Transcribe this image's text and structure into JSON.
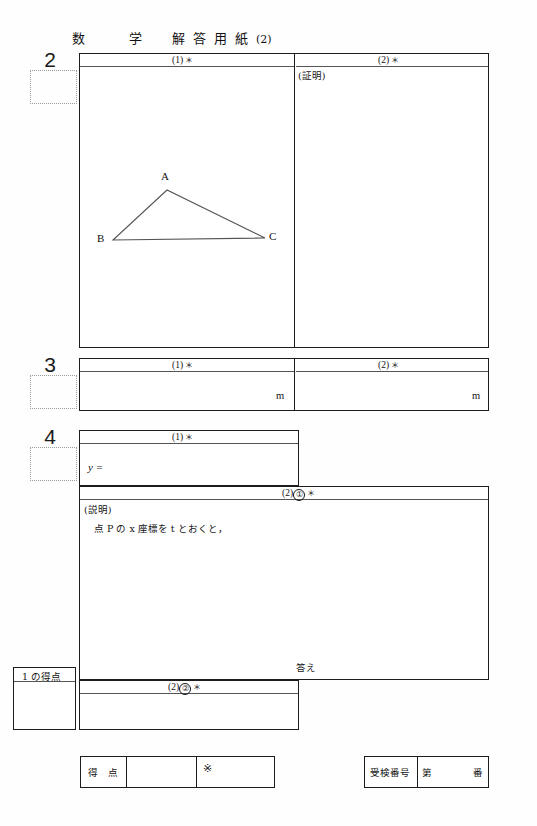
{
  "header": {
    "subject_1": "数",
    "subject_2": "学",
    "doc_1": "解",
    "doc_2": "答",
    "doc_3": "用",
    "doc_4": "紙",
    "sheet_no": "(2)"
  },
  "problems": [
    {
      "number": "2",
      "sections": [
        {
          "label": "(1)",
          "mark": "＊"
        },
        {
          "label": "(2)",
          "mark": "＊",
          "body_label": "(証明)"
        }
      ]
    },
    {
      "number": "3",
      "sections": [
        {
          "label": "(1)",
          "mark": "＊",
          "unit": "m"
        },
        {
          "label": "(2)",
          "mark": "＊",
          "unit": "m"
        }
      ]
    },
    {
      "number": "4",
      "sections": [
        {
          "label": "(1)",
          "mark": "＊",
          "answer_prefix": "y ="
        },
        {
          "label": "(2)",
          "sub": "①",
          "mark": "＊",
          "body_label": "(説明)",
          "body_text": "点 P の x 座標を t とおくと，",
          "answer_label": "答え"
        },
        {
          "label": "(2)",
          "sub": "②",
          "mark": "＊"
        }
      ]
    }
  ],
  "diagram": {
    "type": "triangle",
    "vertices": [
      {
        "name": "A",
        "x": 167,
        "y": 190
      },
      {
        "name": "B",
        "x": 113,
        "y": 240
      },
      {
        "name": "C",
        "x": 265,
        "y": 238
      }
    ]
  },
  "score_boxes": {
    "partial_label": "1 の得点",
    "total_label": "得　点",
    "official_mark": "※"
  },
  "exam_id": {
    "label": "受検番号",
    "prefix": "第",
    "suffix": "番"
  }
}
